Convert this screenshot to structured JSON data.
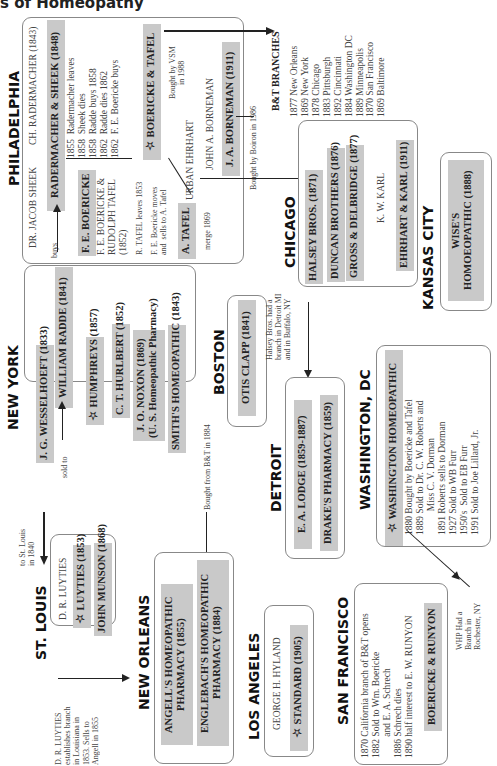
{
  "title": "s of Homeopathy",
  "cities": {
    "philadelphia": "PHILADELPHIA",
    "new_york": "NEW YORK",
    "st_louis": "ST. LOUIS",
    "new_orleans": "NEW ORLEANS",
    "los_angeles": "LOS ANGELES",
    "san_francisco": "SAN FRANCISCO",
    "boston": "BOSTON",
    "detroit": "DETROIT",
    "washington": "WASHINGTON, DC",
    "chicago": "CHICAGO",
    "kansas_city": "KANSAS CITY"
  },
  "philadelphia": {
    "jacob_sheek": "DR. JACOB SHEEK",
    "rademacher": "CH. RADERMACHER (1843)",
    "rademacher_sheek": "RADERMACHER & SHEEK (1848)",
    "timeline": "1855  Radermacher leaves\n1858  Sheek dies\n1858  Radde buys 1858\n1862  Radde dies 1862\n1862  F. E. Boericke buys",
    "buys": "buys",
    "fe_boericke": "F. E. BOERICKE",
    "boericke_tafel_1852": "F. E. BOERICKE &\nRUDOLPH TAFEL\n(1852)",
    "tafel_leaves": "R. TAFEL leaves 1853",
    "boericke_moves": "F. E. Boericke moves\nand  sells to A. Tafel",
    "a_tafel": "A. TAFEL",
    "merge": "merge 1869",
    "boericke_tafel": "☆ BOERICKE & TAFEL",
    "bought_vsm": "Bought by VSM\nin 1988",
    "urban_ehrhart": "URBAN EHRHART",
    "john_borneman": "JOHN A. BORNEMAN",
    "ja_borneman": "J. A. BORNEMAN (1911)",
    "bought_boiron": "Bought by Boiron in 1986"
  },
  "bt_branches": {
    "heading": "B&T BRANCHES",
    "list": "1877 New Orleans\n1869 New York\n1878 Chicago\n1883 Pittsburgh\n1892 Cincinnati\n1884 Washington DC\n1889 Minneapolis\n1870 San Francisco\n1869 Baltimore"
  },
  "new_york": {
    "william_radde": "WILLIAM RADDE (1841)",
    "wesselhoeft": "J. G. WESSELHOEFT (1833)",
    "sold_to": "sold to",
    "humphreys": "☆ HUMPHREYS (1857)",
    "hurlbert": "C. T. HURLBERT (1852)",
    "noxon": "J. O. NOXON (1869)\n(U. S. Homeopathic Pharmacy)",
    "smiths": "SMITH'S HOMEOPATHIC (1843)",
    "to_st_louis": "to St. Louis\nin 1840",
    "bought_from_bt": "Bought from B&T in 1884"
  },
  "st_louis": {
    "dr_luyties": "D. R. LUYTIES",
    "luyties": "☆ LUYTIES (1853)",
    "john_munson": "JOHN MUNSON (1868)",
    "note": "D. R. LUYTIES\nestablishes branch\nin Louisiana in\n1853. Sells to\nAngell in 1855"
  },
  "new_orleans": {
    "angells": "ANGELL'S HOMEOPATHIC\nPHARMACY (1855)",
    "englebachs": "ENGLEBACH'S HOMEOPATHIC\nPHARMACY (1884)"
  },
  "los_angeles": {
    "hyland": "GEORGE H. HYLAND",
    "standard": "☆ STANDARD (1905)"
  },
  "san_francisco": {
    "timeline": "1870 California branch of B&T opens\n1882 Sold to Wm. Boericke\n         and E. A. Schrech\n1886 Schrech dies\n1890 half interest to E. W. RUNYON",
    "boericke_runyon": "BOERICKE & RUNYON"
  },
  "boston": {
    "otis_clapp": "OTIS CLAPP (1841)"
  },
  "detroit": {
    "lodge": "E. A. LODGE (1859-1887)",
    "drakes": "DRAKE'S PHARMACY (1859)",
    "halsey_note": "Halsey Bros. had a\nbranch in Detroit MI\nand in Buffalo, NY"
  },
  "washington": {
    "whp": "☆ WASHINGTON  HOMEOPATHIC",
    "timeline": "1880 Bought by Boericke and Tafel\n1889 Sold to Dr. C. W. Roberts and\n          Miss C. V. Dorman\n1891 Roberts sells to Dorman\n1927 Sold to WB Furr\n1950's  Sold to EB Furr\n1991 Sold to Joe Lillard, Jr.",
    "rochester_note": "WHP Had a\nBranch in\nRochester, NY"
  },
  "chicago": {
    "halsey": "HALSEY BROS. (1871)",
    "duncan": "DUNCAN BROTHERS (1876)",
    "gross": "GROSS & DELBRIDGE (1877)",
    "kw_karl": "K. W. KARL",
    "ehrhart_karl": "EHRHART & KARL (1911)"
  },
  "kansas_city": {
    "wises": "WISE'S\nHOMOEOPATHIC (1888)"
  }
}
